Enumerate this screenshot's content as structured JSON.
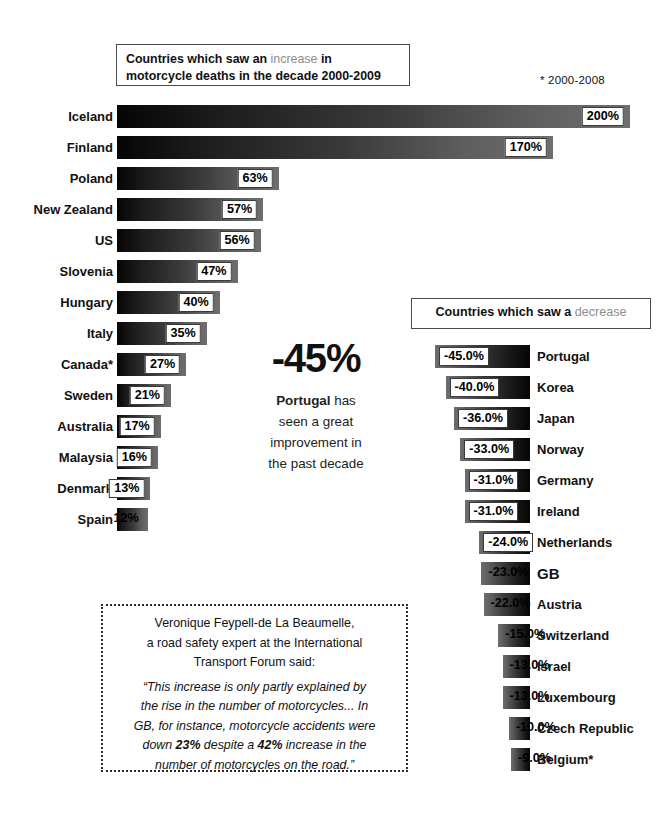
{
  "increase_header": {
    "line1_pre": "Countries which saw an ",
    "line1_hl": "increase",
    "line1_post": " in",
    "line2": "motorcycle deaths in the decade 2000-2009"
  },
  "footnote": "* 2000-2008",
  "decrease_header": {
    "pre": "Countries which saw a ",
    "hl": "decrease"
  },
  "callout": {
    "value": "-45%",
    "country": "Portugal",
    "line1_rest": " has",
    "line2": "seen a great",
    "line3": "improvement in",
    "line4": "the past decade"
  },
  "quote": {
    "attr_line1": "Veronique Feypell-de La Beaumelle,",
    "attr_line2": "a road safety expert at the International",
    "attr_line3": "Transport Forum said:",
    "body_l1": "“This increase is only partly explained by",
    "body_l2": "the rise in the number of motorcycles... In",
    "body_l3": "GB, for instance, motorcycle accidents were",
    "body_l4_a": "down ",
    "body_l4_b": "23%",
    "body_l4_c": " despite a ",
    "body_l4_d": "42%",
    "body_l4_e": " increase in the",
    "body_l5": "number of motorcycles on the road.”"
  },
  "chart_data": [
    {
      "type": "bar",
      "title": "Countries which saw an increase in motorcycle deaths in the decade 2000-2009",
      "orientation": "horizontal",
      "xlabel": "",
      "ylabel": "",
      "xlim": [
        0,
        200
      ],
      "grid": false,
      "categories": [
        "Iceland",
        "Finland",
        "Poland",
        "New Zealand",
        "US",
        "Slovenia",
        "Hungary",
        "Italy",
        "Canada*",
        "Sweden",
        "Australia",
        "Malaysia",
        "Denmark",
        "Spain"
      ],
      "values": [
        200,
        170,
        63,
        57,
        56,
        47,
        40,
        35,
        27,
        21,
        17,
        16,
        13,
        12
      ],
      "labels": [
        "200%",
        "170%",
        "63%",
        "57%",
        "56%",
        "47%",
        "40%",
        "35%",
        "27%",
        "21%",
        "17%",
        "16%",
        "13%",
        "12%"
      ],
      "label_style": [
        "boxed",
        "boxed",
        "boxed",
        "boxed",
        "boxed",
        "boxed",
        "boxed",
        "boxed",
        "boxed",
        "boxed",
        "boxed",
        "boxed",
        "boxed",
        "plain"
      ]
    },
    {
      "type": "bar",
      "title": "Countries which saw a decrease",
      "orientation": "horizontal",
      "xlabel": "",
      "ylabel": "",
      "xlim": [
        -45,
        0
      ],
      "grid": false,
      "categories": [
        "Portugal",
        "Korea",
        "Japan",
        "Norway",
        "Germany",
        "Ireland",
        "Netherlands",
        "GB",
        "Austria",
        "Switzerland",
        "Israel",
        "Luxembourg",
        "Czech Republic",
        "Belgium*"
      ],
      "values": [
        -45.0,
        -40.0,
        -36.0,
        -33.0,
        -31.0,
        -31.0,
        -24.0,
        -23.0,
        -22.0,
        -15.0,
        -13.0,
        -13.0,
        -10.0,
        -9.0
      ],
      "labels": [
        "-45.0%",
        "-40.0%",
        "-36.0%",
        "-33.0%",
        "-31.0%",
        "-31.0%",
        "-24.0%",
        "-23.0%",
        "-22.0%",
        "-15.0%",
        "-13.0%",
        "-13.0%",
        "-10.0%",
        "-9.0%"
      ],
      "label_style": [
        "boxed",
        "boxed",
        "boxed",
        "boxed",
        "boxed",
        "boxed",
        "boxed",
        "plain",
        "plain",
        "plain",
        "plain",
        "plain",
        "plain",
        "plain"
      ],
      "emphasis": [
        "",
        "",
        "",
        "",
        "",
        "",
        "",
        "GB",
        "",
        "",
        "",
        "",
        "",
        ""
      ]
    }
  ],
  "colors": {
    "highlight_text": "#8d8d8d",
    "bar_dark": "#050505",
    "bar_light": "#6e6e6e",
    "border": "#4a4a4a"
  }
}
